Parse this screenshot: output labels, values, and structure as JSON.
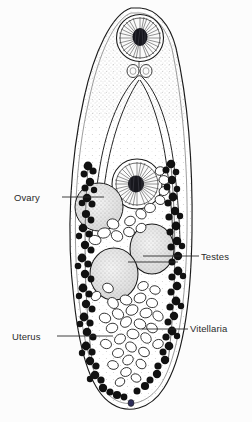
{
  "figure": {
    "organism": "digenean trematode",
    "view": "whole-mount dorsal",
    "background_color": "#fcfcfc",
    "ink_color": "#1a1a1a",
    "stipple_color": "#8c8c8c",
    "vitellaria_color": "#111111"
  },
  "labels": [
    {
      "id": "ovary",
      "text": "Ovary",
      "side": "left",
      "leader_from_x": 62,
      "leader_to_x": 104,
      "leader_y": 197
    },
    {
      "id": "testes",
      "text": "Testes",
      "side": "right",
      "leader_from_x": 199,
      "leader_to_x": 128,
      "leader_y": 256
    },
    {
      "id": "uterus",
      "text": "Uterus",
      "side": "left",
      "leader_from_x": 57,
      "leader_to_x": 113,
      "leader_y": 336
    },
    {
      "id": "vitellaria",
      "text": "Vitellaria",
      "side": "right",
      "leader_from_x": 188,
      "leader_to_x": 142,
      "leader_y": 329
    }
  ],
  "structures": [
    {
      "name": "oral-sucker",
      "shape": "circle",
      "cx": 140,
      "cy": 38,
      "r": 23,
      "fill": "radiating-muscle-striations"
    },
    {
      "name": "pharynx",
      "shape": "pair-of-small-ovals",
      "cx": 140,
      "cy": 70
    },
    {
      "name": "intestinal-ceca",
      "shape": "long-inverted-u-loop",
      "top_y": 78,
      "bottom_y": 240
    },
    {
      "name": "ventral-sucker",
      "shape": "circle",
      "cx": 137,
      "cy": 184,
      "r": 25,
      "fill": "radiating-muscle-striations"
    },
    {
      "name": "ovary",
      "shape": "stippled-circle",
      "cx": 99,
      "cy": 206,
      "r": 24
    },
    {
      "name": "testis-anterior",
      "shape": "stippled-oval",
      "cx": 152,
      "cy": 249,
      "rx": 22,
      "ry": 25
    },
    {
      "name": "testis-posterior",
      "shape": "stippled-oval",
      "cx": 114,
      "cy": 272,
      "rx": 24,
      "ry": 26
    },
    {
      "name": "uterus",
      "shape": "egg-mass",
      "cx": 127,
      "cy": 320,
      "width": 80,
      "height": 110
    },
    {
      "name": "vitellaria",
      "shape": "lateral-follicle-chains",
      "left_x": 78,
      "right_x": 176,
      "top_y": 160,
      "bottom_y": 400
    }
  ]
}
